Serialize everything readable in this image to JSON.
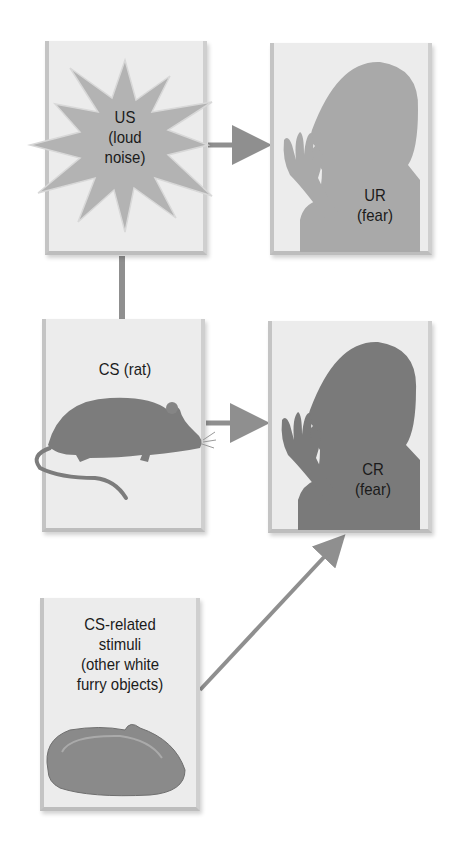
{
  "diagram": {
    "type": "classical-conditioning-flow",
    "nodes": {
      "us": {
        "lines": [
          "US",
          "(loud",
          "noise)"
        ]
      },
      "ur": {
        "lines": [
          "UR",
          "(fear)"
        ]
      },
      "cs": {
        "lines": [
          "CS (rat)"
        ]
      },
      "cr": {
        "lines": [
          "CR",
          "(fear)"
        ]
      },
      "cs_related": {
        "lines": [
          "CS-related",
          "stimuli",
          "(other white",
          "furry objects)"
        ]
      }
    },
    "edges": [
      {
        "from": "us",
        "to": "ur",
        "style": "arrow"
      },
      {
        "from": "us",
        "to": "cs",
        "style": "line"
      },
      {
        "from": "cs",
        "to": "cr",
        "style": "arrow"
      },
      {
        "from": "cs_related",
        "to": "cr",
        "style": "arrow"
      }
    ],
    "colors": {
      "box_fill": "#ececec",
      "connector": "#8f8f8f",
      "burst": "#b3b3b3",
      "ur_silhouette": "#a9a9a9",
      "cr_silhouette": "#7a7a7a",
      "rat": "#7c7c7c",
      "slipper": "#8a8a8a"
    }
  }
}
